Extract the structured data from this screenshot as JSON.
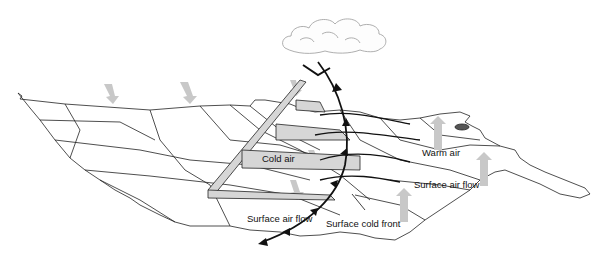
{
  "diagram": {
    "type": "cold-front-cross-section-over-map",
    "labels": {
      "cold_air": "Cold air",
      "warm_air": "Warm air",
      "surface_air_flow_left": "Surface air flow",
      "surface_air_flow_right": "Surface air flow",
      "surface_cold_front": "Surface cold front"
    },
    "colors": {
      "map_line": "#222222",
      "front_line": "#111111",
      "arrow_fill": "#c8c8c8",
      "wedge_fill": "#d6d6d6",
      "cloud_line": "#9a9a9a"
    },
    "icons": [
      "cloud-icon",
      "cold-front-symbol",
      "air-flow-arrow"
    ]
  }
}
